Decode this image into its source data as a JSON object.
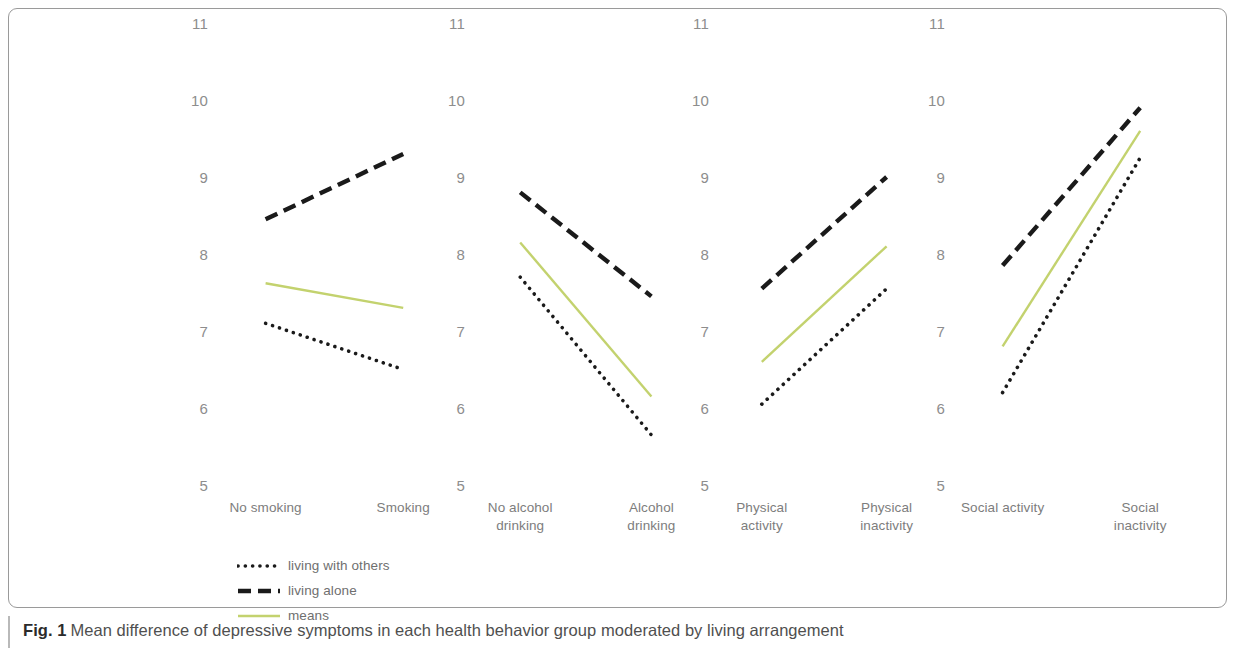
{
  "figure": {
    "caption_label": "Fig. 1",
    "caption_text": "Mean difference of depressive symptoms in each health behavior group moderated by living arrangement"
  },
  "legend": {
    "position": "below-plot-left",
    "items": [
      {
        "label": "living with others",
        "style": "dotted",
        "color": "#1a1a1a"
      },
      {
        "label": "living alone",
        "style": "dashed",
        "color": "#1a1a1a"
      },
      {
        "label": "means",
        "style": "solid",
        "color": "#c3d26e"
      }
    ]
  },
  "chart_data": {
    "type": "line",
    "title": "Mean difference of depressive symptoms in each health behavior group moderated by living arrangement",
    "xlabel": "",
    "ylabel": "",
    "ylim": [
      5,
      11
    ],
    "yticks": [
      11,
      10,
      9,
      8,
      7,
      6,
      5
    ],
    "grid": false,
    "legend": [
      "living with others",
      "living alone",
      "means"
    ],
    "series_colors": {
      "living with others": "#1a1a1a",
      "living alone": "#1a1a1a",
      "means": "#c3d26e"
    },
    "panels": [
      {
        "name": "smoking",
        "categories": [
          "No smoking",
          "Smoking"
        ],
        "series": [
          {
            "name": "living alone",
            "style": "dashed",
            "values": [
              8.45,
              9.3
            ]
          },
          {
            "name": "means",
            "style": "solid",
            "values": [
              7.62,
              7.3
            ]
          },
          {
            "name": "living with others",
            "style": "dotted",
            "values": [
              7.1,
              6.5
            ]
          }
        ]
      },
      {
        "name": "alcohol drinking",
        "categories": [
          "No alcohol\ndrinking",
          "Alcohol\ndrinking"
        ],
        "series": [
          {
            "name": "living alone",
            "style": "dashed",
            "values": [
              8.8,
              7.45
            ]
          },
          {
            "name": "means",
            "style": "solid",
            "values": [
              8.15,
              6.15
            ]
          },
          {
            "name": "living with others",
            "style": "dotted",
            "values": [
              7.7,
              5.65
            ]
          }
        ]
      },
      {
        "name": "physical activity",
        "categories": [
          "Physical\nactivity",
          "Physical\ninactivity"
        ],
        "series": [
          {
            "name": "living alone",
            "style": "dashed",
            "values": [
              7.55,
              9.0
            ]
          },
          {
            "name": "means",
            "style": "solid",
            "values": [
              6.6,
              8.1
            ]
          },
          {
            "name": "living with others",
            "style": "dotted",
            "values": [
              6.05,
              7.55
            ]
          }
        ]
      },
      {
        "name": "social activity",
        "categories": [
          "Social activity",
          "Social\ninactivity"
        ],
        "series": [
          {
            "name": "living alone",
            "style": "dashed",
            "values": [
              7.85,
              9.9
            ]
          },
          {
            "name": "means",
            "style": "solid",
            "values": [
              6.8,
              9.6
            ]
          },
          {
            "name": "living with others",
            "style": "dotted",
            "values": [
              6.2,
              9.25
            ]
          }
        ]
      }
    ]
  }
}
